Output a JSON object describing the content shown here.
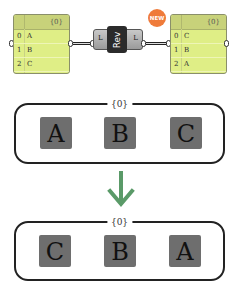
{
  "input_panel": {
    "path": "{0}",
    "rows": [
      {
        "index": "0",
        "value": "A"
      },
      {
        "index": "1",
        "value": "B"
      },
      {
        "index": "2",
        "value": "C"
      }
    ]
  },
  "component": {
    "name": "Rev",
    "input_param": "L",
    "output_param": "L",
    "badge": "NEW",
    "badge_color": "#ef7b3a"
  },
  "output_panel": {
    "path": "{0}",
    "rows": [
      {
        "index": "0",
        "value": "C"
      },
      {
        "index": "1",
        "value": "B"
      },
      {
        "index": "2",
        "value": "A"
      }
    ]
  },
  "before": {
    "path": "{0}",
    "items": [
      "A",
      "B",
      "C"
    ]
  },
  "arrow": {
    "direction": "down",
    "color": "#5a9a68"
  },
  "after": {
    "path": "{0}",
    "items": [
      "C",
      "B",
      "A"
    ]
  }
}
